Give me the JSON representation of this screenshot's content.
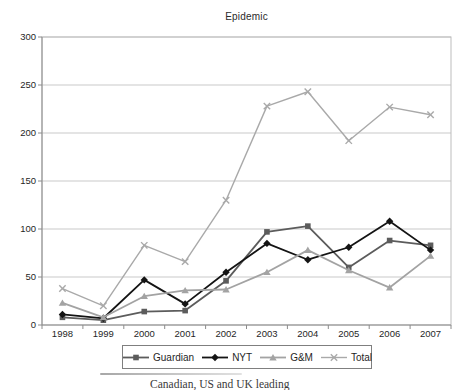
{
  "title": "Epidemic",
  "chart_data": {
    "type": "line",
    "title": "Epidemic",
    "categories": [
      "1998",
      "1999",
      "2000",
      "2001",
      "2002",
      "2003",
      "2004",
      "2005",
      "2006",
      "2007"
    ],
    "series": [
      {
        "name": "Guardian",
        "marker": "square",
        "color": "#5c5c5c",
        "values": [
          8,
          5,
          14,
          15,
          46,
          97,
          103,
          60,
          88,
          83
        ]
      },
      {
        "name": "NYT",
        "marker": "diamond",
        "color": "#141414",
        "values": [
          11,
          7,
          47,
          22,
          55,
          85,
          68,
          81,
          108,
          78
        ]
      },
      {
        "name": "G&M",
        "marker": "triangle",
        "color": "#a3a3a3",
        "values": [
          23,
          8,
          30,
          36,
          37,
          55,
          78,
          57,
          39,
          72
        ]
      },
      {
        "name": "Total",
        "marker": "x",
        "color": "#a9a9a9",
        "values": [
          38,
          20,
          83,
          66,
          130,
          228,
          243,
          192,
          227,
          219
        ]
      }
    ],
    "xlabel": "",
    "ylabel": "",
    "ylim": [
      0,
      300
    ],
    "ytick_step": 50,
    "grid": true,
    "legend_position": "bottom"
  },
  "caption": {
    "fragment": "Canadian, US and UK leading"
  },
  "colors": {
    "gridline": "#c9c9c9",
    "plot_border": "#bdbdbd",
    "axis": "#8c8c8c",
    "tick": "#8c8c8c",
    "text": "#1f1f1f",
    "legend_border": "#7f7f7f",
    "background": "#ffffff"
  }
}
